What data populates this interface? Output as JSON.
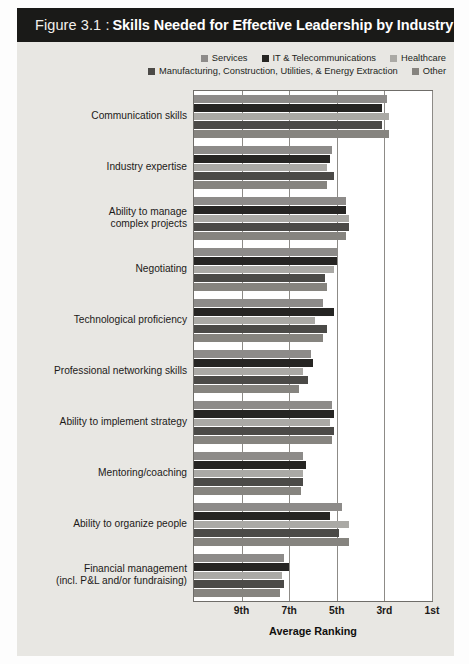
{
  "figure": {
    "number": "Figure 3.1 :",
    "title": "Skills Needed for Effective Leadership by Industry"
  },
  "colors": {
    "title_bar_bg": "#1a1a18",
    "panel_bg": "#e8e7e3",
    "plot_bg": "#ffffff",
    "axis": "#6f6d69",
    "gridline": "#8d8b87",
    "text": "#1c1a18",
    "series": [
      "#8d8b89",
      "#262523",
      "#aaa9a5",
      "#4b4a47",
      "#86847f"
    ]
  },
  "chart_data": {
    "type": "bar",
    "orientation": "horizontal",
    "title": "Skills Needed for Effective Leadership by Industry",
    "xlabel": "Average Ranking",
    "ylabel": "",
    "grid": true,
    "legend_position": "top-right",
    "xlim": [
      11,
      1
    ],
    "x_axis_reversed": true,
    "xticks": [
      "9th",
      "7th",
      "5th",
      "3rd",
      "1st"
    ],
    "xtick_values": [
      9,
      7,
      5,
      3,
      1
    ],
    "categories": [
      "Communication skills",
      "Industry expertise",
      "Ability to manage complex projects",
      "Negotiating",
      "Technological proficiency",
      "Professional networking skills",
      "Ability to implement strategy",
      "Mentoring/coaching",
      "Ability to organize people",
      "Financial management (incl. P&L and/or fundraising)"
    ],
    "category_lines": [
      [
        "Communication skills"
      ],
      [
        "Industry expertise"
      ],
      [
        "Ability to manage",
        "complex projects"
      ],
      [
        "Negotiating"
      ],
      [
        "Technological proficiency"
      ],
      [
        "Professional networking skills"
      ],
      [
        "Ability to implement strategy"
      ],
      [
        "Mentoring/coaching"
      ],
      [
        "Ability to organize people"
      ],
      [
        "Financial management",
        "(incl. P&L and/or fundraising)"
      ]
    ],
    "series": [
      {
        "name": "Services",
        "color": "#8d8b89",
        "values": [
          2.9,
          5.2,
          4.6,
          5.0,
          5.6,
          6.1,
          5.2,
          6.4,
          4.8,
          7.2
        ]
      },
      {
        "name": "IT & Telecommunications",
        "color": "#262523",
        "values": [
          3.1,
          5.3,
          4.6,
          5.0,
          5.1,
          6.0,
          5.1,
          6.3,
          5.3,
          7.0
        ]
      },
      {
        "name": "Healthcare",
        "color": "#aaa9a5",
        "values": [
          2.8,
          5.4,
          4.5,
          5.1,
          5.9,
          6.4,
          5.3,
          6.4,
          4.5,
          7.3
        ]
      },
      {
        "name": "Manufacturing, Construction, Utilities, & Energy Extraction",
        "color": "#4b4a47",
        "values": [
          3.1,
          5.1,
          4.5,
          5.5,
          5.4,
          6.2,
          5.1,
          6.4,
          4.9,
          7.2
        ]
      },
      {
        "name": "Other",
        "color": "#86847f",
        "values": [
          2.8,
          5.4,
          4.6,
          5.4,
          5.6,
          6.6,
          5.2,
          6.5,
          4.5,
          7.4
        ]
      }
    ]
  },
  "legend": {
    "row1": [
      {
        "label": "Services",
        "color": "#8d8b89"
      },
      {
        "label": "IT & Telecommunications",
        "color": "#262523"
      },
      {
        "label": "Healthcare",
        "color": "#aaa9a5"
      }
    ],
    "row2": [
      {
        "label": "Manufacturing, Construction, Utilities, & Energy Extraction",
        "color": "#4b4a47"
      },
      {
        "label": "Other",
        "color": "#86847f"
      }
    ]
  }
}
